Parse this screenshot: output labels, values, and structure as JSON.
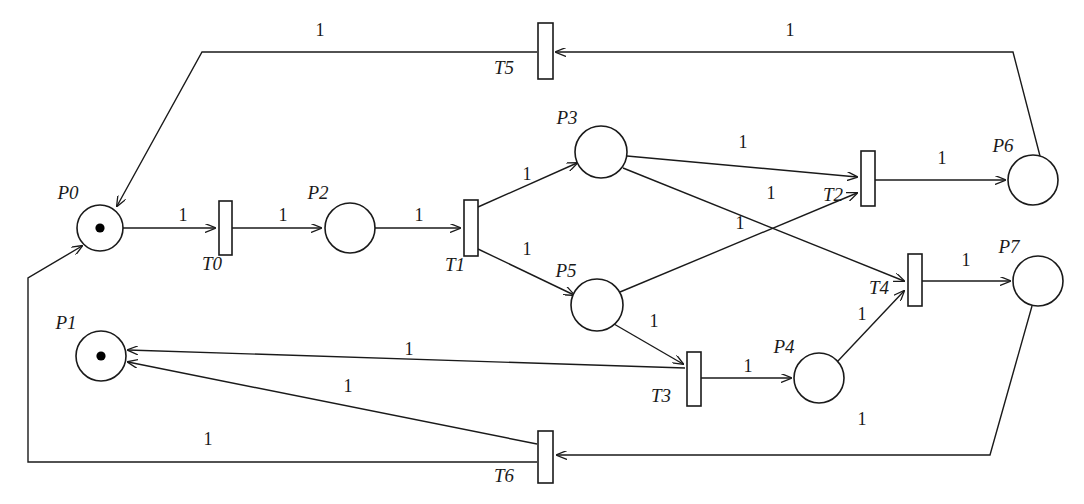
{
  "diagram": {
    "type": "petri-net",
    "colors": {
      "stroke": "#1a1a1a",
      "fill": "#ffffff",
      "token": "#000000",
      "background": "#ffffff"
    },
    "places": [
      {
        "id": "P0",
        "label": "P0",
        "cx": 100,
        "cy": 228,
        "r": 23,
        "tokens": 1,
        "label_x": 68,
        "label_y": 199
      },
      {
        "id": "P1",
        "label": "P1",
        "cx": 101,
        "cy": 356,
        "r": 25,
        "tokens": 1,
        "label_x": 66,
        "label_y": 329
      },
      {
        "id": "P2",
        "label": "P2",
        "cx": 350,
        "cy": 228,
        "r": 25,
        "tokens": 0,
        "label_x": 318,
        "label_y": 199
      },
      {
        "id": "P3",
        "label": "P3",
        "cx": 601,
        "cy": 152,
        "r": 26,
        "tokens": 0,
        "label_x": 567,
        "label_y": 124
      },
      {
        "id": "P4",
        "label": "P4",
        "cx": 819,
        "cy": 378,
        "r": 25,
        "tokens": 0,
        "label_x": 784,
        "label_y": 353
      },
      {
        "id": "P5",
        "label": "P5",
        "cx": 597,
        "cy": 305,
        "r": 26,
        "tokens": 0,
        "label_x": 566,
        "label_y": 277
      },
      {
        "id": "P6",
        "label": "P6",
        "cx": 1033,
        "cy": 180,
        "r": 25,
        "tokens": 0,
        "label_x": 1003,
        "label_y": 152
      },
      {
        "id": "P7",
        "label": "P7",
        "cx": 1038,
        "cy": 281,
        "r": 25,
        "tokens": 0,
        "label_x": 1009,
        "label_y": 253
      }
    ],
    "transitions": [
      {
        "id": "T0",
        "label": "T0",
        "x": 219,
        "y": 201,
        "w": 13,
        "h": 54,
        "label_x": 212,
        "label_y": 270
      },
      {
        "id": "T1",
        "label": "T1",
        "x": 464,
        "y": 200,
        "w": 14,
        "h": 56,
        "label_x": 455,
        "label_y": 271
      },
      {
        "id": "T2",
        "label": "T2",
        "x": 861,
        "y": 151,
        "w": 14,
        "h": 55,
        "label_x": 833,
        "label_y": 201
      },
      {
        "id": "T3",
        "label": "T3",
        "x": 687,
        "y": 352,
        "w": 14,
        "h": 54,
        "label_x": 661,
        "label_y": 402
      },
      {
        "id": "T4",
        "label": "T4",
        "x": 908,
        "y": 254,
        "w": 14,
        "h": 52,
        "label_x": 879,
        "label_y": 294
      },
      {
        "id": "T5",
        "label": "T5",
        "x": 538,
        "y": 23,
        "w": 15,
        "h": 56,
        "label_x": 504,
        "label_y": 74
      },
      {
        "id": "T6",
        "label": "T6",
        "x": 538,
        "y": 431,
        "w": 15,
        "h": 52,
        "label_x": 504,
        "label_y": 482
      }
    ],
    "arcs": [
      {
        "id": "arc-p0-t0",
        "from": "P0",
        "to": "T0",
        "weight": "1",
        "points": "123,228 215,228",
        "weight_x": 183,
        "weight_y": 221
      },
      {
        "id": "arc-t0-p2",
        "from": "T0",
        "to": "P2",
        "weight": "1",
        "points": "232,228 321,228",
        "weight_x": 283,
        "weight_y": 221
      },
      {
        "id": "arc-p2-t1",
        "from": "P2",
        "to": "T1",
        "weight": "1",
        "points": "375,228 460,228",
        "weight_x": 419,
        "weight_y": 221
      },
      {
        "id": "arc-t1-p3",
        "from": "T1",
        "to": "P3",
        "weight": "1",
        "points": "478,207 577,163",
        "weight_x": 527,
        "weight_y": 180
      },
      {
        "id": "arc-t1-p5",
        "from": "T1",
        "to": "P5",
        "weight": "1",
        "points": "478,249 574,295",
        "weight_x": 527,
        "weight_y": 255
      },
      {
        "id": "arc-p3-t2",
        "from": "P3",
        "to": "T2",
        "weight": "1",
        "points": "627,156 857,177",
        "weight_x": 743,
        "weight_y": 148
      },
      {
        "id": "arc-p3-t4",
        "from": "P3",
        "to": "T4",
        "weight": "1",
        "points": "623,168 904,281",
        "weight_x": 740,
        "weight_y": 229
      },
      {
        "id": "arc-p5-t2",
        "from": "P5",
        "to": "T2",
        "weight": "1",
        "points": "620,292 857,193",
        "weight_x": 771,
        "weight_y": 199
      },
      {
        "id": "arc-p5-t3",
        "from": "P5",
        "to": "T3",
        "weight": "1",
        "points": "614,324 683,364",
        "weight_x": 654,
        "weight_y": 327
      },
      {
        "id": "arc-t2-p6",
        "from": "T2",
        "to": "P6",
        "weight": "1",
        "points": "875,180 1005,180",
        "weight_x": 942,
        "weight_y": 164
      },
      {
        "id": "arc-t3-p4",
        "from": "T3",
        "to": "P4",
        "weight": "1",
        "points": "701,378 791,378",
        "weight_x": 748,
        "weight_y": 372
      },
      {
        "id": "arc-p4-t4",
        "from": "P4",
        "to": "T4",
        "weight": "1",
        "points": "837,362 904,291",
        "weight_x": 862,
        "weight_y": 320
      },
      {
        "id": "arc-t4-p7",
        "from": "T4",
        "to": "P7",
        "weight": "1",
        "points": "922,281 1010,281",
        "weight_x": 966,
        "weight_y": 266
      },
      {
        "id": "arc-p6-t5",
        "from": "P6",
        "to": "T5",
        "weight": "1",
        "points": "1040,156 1013,52 556,52",
        "weight_x": 790,
        "weight_y": 36
      },
      {
        "id": "arc-t5-p0",
        "from": "T5",
        "to": "P0",
        "weight": "1",
        "points": "537,52 202,52 117,206",
        "weight_x": 320,
        "weight_y": 36
      },
      {
        "id": "arc-t3-p1",
        "from": "T3",
        "to": "P1",
        "weight": "1",
        "points": "685,368 128,350",
        "weight_x": 409,
        "weight_y": 355
      },
      {
        "id": "arc-t6-p1",
        "from": "T6",
        "to": "P1",
        "weight": "1",
        "points": "537,444 128,362",
        "weight_x": 348,
        "weight_y": 392
      },
      {
        "id": "arc-p7-t6",
        "from": "P7",
        "to": "T6",
        "weight": "1",
        "points": "1032,306 990,455 557,455",
        "weight_x": 862,
        "weight_y": 425
      },
      {
        "id": "arc-t6-p0",
        "from": "T6",
        "to": "P0",
        "weight": "1",
        "points": "537,462 28,462 28,278 82,246",
        "weight_x": 208,
        "weight_y": 445
      }
    ]
  }
}
